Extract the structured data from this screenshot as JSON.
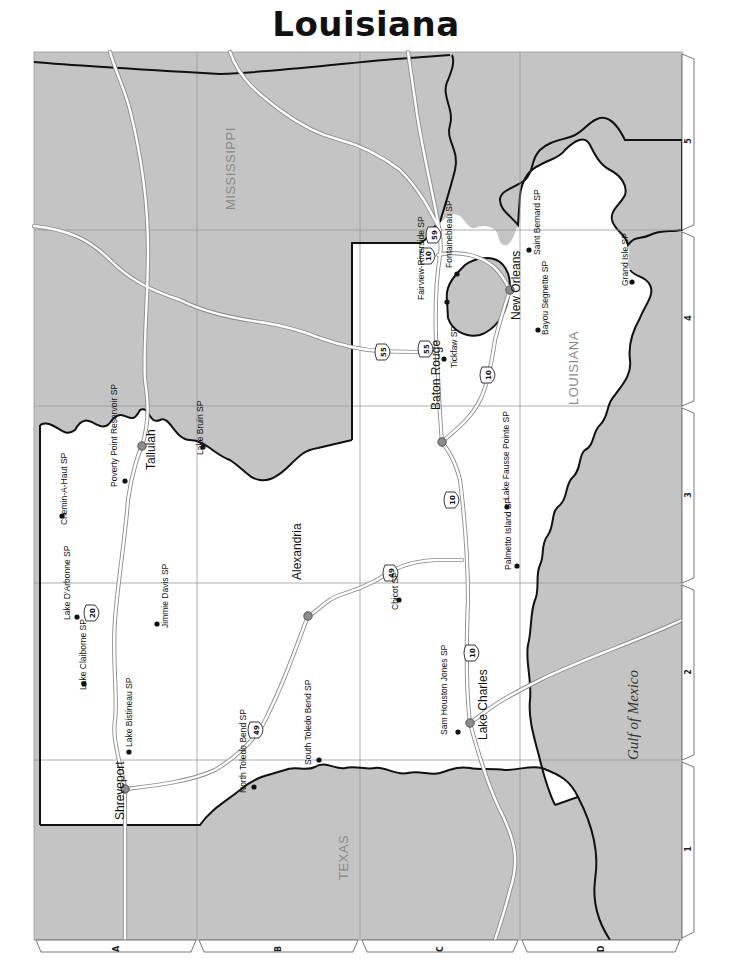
{
  "title": "Louisiana",
  "colors": {
    "land_other": "#c4c4c4",
    "land_louisiana": "#ffffff",
    "water": "#c4c4c4",
    "border": "#111111",
    "grid": "#9a9a9a",
    "highway": "#ffffff",
    "highway_casing": "#8c8c8c",
    "city_marker": "#8c8c8c",
    "park_marker": "#111111"
  },
  "map_frame": {
    "x": 34,
    "y": 52,
    "width": 648,
    "height": 888
  },
  "grid": {
    "column_labels": [
      "A",
      "B",
      "C",
      "D"
    ],
    "row_labels": [
      "1",
      "2",
      "3",
      "4",
      "5"
    ],
    "vertical_lines_x": [
      197,
      360,
      520
    ],
    "horizontal_lines_y": [
      230,
      406,
      583,
      760
    ]
  },
  "regions": {
    "mississippi": {
      "label": "MISSISSIPPI",
      "x": 228,
      "y": 175
    },
    "texas": {
      "label": "TEXAS",
      "x": 343,
      "y": 866
    },
    "louisiana": {
      "label": "LOUISIANA",
      "x": 572,
      "y": 362
    },
    "gulf": {
      "label": "Gulf of Mexico",
      "x": 642,
      "y": 716
    }
  },
  "cities": [
    {
      "name": "Shreveport",
      "x": 125,
      "y": 789,
      "lx": 124,
      "ly": 820
    },
    {
      "name": "Tallulah",
      "x": 142,
      "y": 446,
      "lx": 155,
      "ly": 470
    },
    {
      "name": "Alexandria",
      "x": 308,
      "y": 616,
      "lx": 301,
      "ly": 580
    },
    {
      "name": "Baton Rouge",
      "x": 442,
      "y": 442,
      "lx": 440,
      "ly": 410
    },
    {
      "name": "New Orleans",
      "x": 510,
      "y": 290,
      "lx": 520,
      "ly": 320
    },
    {
      "name": "Lake Charles",
      "x": 470,
      "y": 723,
      "lx": 487,
      "ly": 740
    }
  ],
  "parks": [
    {
      "name": "Chemin-A-Haut SP",
      "x": 62,
      "y": 516,
      "lx": 67,
      "ly": 525
    },
    {
      "name": "Poverty Point Reservoir SP",
      "x": 125,
      "y": 481,
      "lx": 117,
      "ly": 487
    },
    {
      "name": "Lake Bruin SP",
      "x": 203,
      "y": 447,
      "lx": 203,
      "ly": 455
    },
    {
      "name": "Lake D'Arbonne SP",
      "x": 77,
      "y": 617,
      "lx": 70,
      "ly": 620
    },
    {
      "name": "Jimmie Davis SP",
      "x": 157,
      "y": 624,
      "lx": 168,
      "ly": 628
    },
    {
      "name": "Lake Claiborne SP",
      "x": 84,
      "y": 684,
      "lx": 86,
      "ly": 690
    },
    {
      "name": "Lake Bistineau SP",
      "x": 129,
      "y": 752,
      "lx": 132,
      "ly": 747
    },
    {
      "name": "North Toledo Bend SP",
      "x": 254,
      "y": 787,
      "lx": 246,
      "ly": 793
    },
    {
      "name": "South Toledo Bend SP",
      "x": 319,
      "y": 760,
      "lx": 311,
      "ly": 765
    },
    {
      "name": "Chicot SP",
      "x": 399,
      "y": 600,
      "lx": 398,
      "ly": 610
    },
    {
      "name": "Sam Houston Jones SP",
      "x": 458,
      "y": 732,
      "lx": 447,
      "ly": 735
    },
    {
      "name": "Palmetto Island SP",
      "x": 517,
      "y": 566,
      "lx": 511,
      "ly": 570
    },
    {
      "name": "Lake Fausse Pointe SP",
      "x": 507,
      "y": 507,
      "lx": 509,
      "ly": 500
    },
    {
      "name": "Tickfaw SP",
      "x": 444,
      "y": 359,
      "lx": 457,
      "ly": 368
    },
    {
      "name": "Fairview-Riverside SP",
      "x": 447,
      "y": 302,
      "lx": 424,
      "ly": 300
    },
    {
      "name": "Fontainebleau SP",
      "x": 457,
      "y": 274,
      "lx": 452,
      "ly": 268
    },
    {
      "name": "Bayou Segnette SP",
      "x": 538,
      "y": 330,
      "lx": 548,
      "ly": 335
    },
    {
      "name": "Saint Bernard SP",
      "x": 529,
      "y": 250,
      "lx": 540,
      "ly": 255
    },
    {
      "name": "Grand Isle SP",
      "x": 632,
      "y": 282,
      "lx": 628,
      "ly": 286
    }
  ],
  "highway_shields": [
    {
      "label": "20",
      "x": 92,
      "y": 613
    },
    {
      "label": "49",
      "x": 256,
      "y": 730
    },
    {
      "label": "49",
      "x": 391,
      "y": 573
    },
    {
      "label": "10",
      "x": 472,
      "y": 653
    },
    {
      "label": "10",
      "x": 452,
      "y": 500
    },
    {
      "label": "10",
      "x": 488,
      "y": 375
    },
    {
      "label": "10",
      "x": 428,
      "y": 256
    },
    {
      "label": "55",
      "x": 426,
      "y": 349
    },
    {
      "label": "55",
      "x": 383,
      "y": 352
    },
    {
      "label": "59",
      "x": 434,
      "y": 235
    }
  ]
}
